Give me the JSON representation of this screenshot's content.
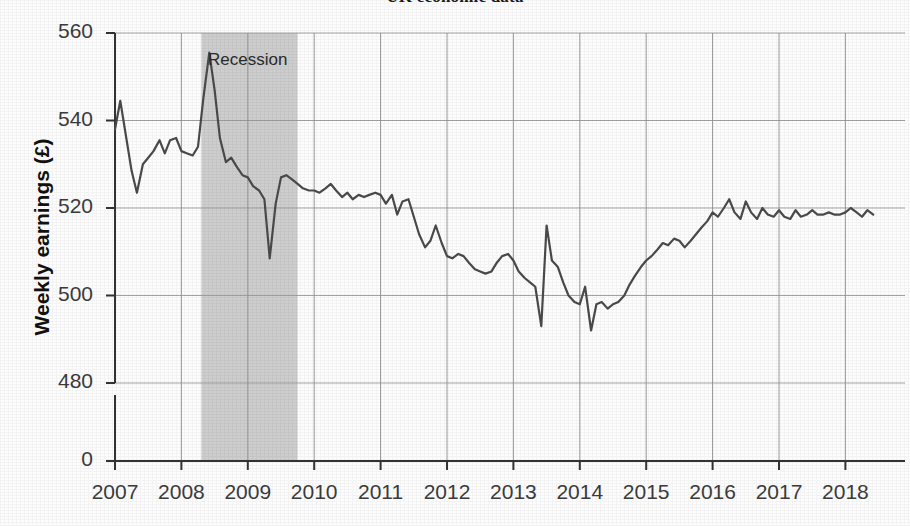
{
  "figure": {
    "title_partial": "UK economic data",
    "recession_label": "Recession"
  },
  "chart_data": {
    "type": "line",
    "title": "UK economic data",
    "xlabel": "",
    "ylabel": "Weekly earnings (£)",
    "ylim": [
      476,
      562
    ],
    "axis_break": true,
    "zero_tick": "0",
    "grid": true,
    "legend": null,
    "ytick_labels": [
      "560",
      "540",
      "520",
      "500",
      "480",
      "0"
    ],
    "ytick_values": [
      560,
      540,
      520,
      500,
      480,
      0
    ],
    "xtick_labels": [
      "2007",
      "2008",
      "2009",
      "2010",
      "2011",
      "2012",
      "2013",
      "2014",
      "2015",
      "2016",
      "2017",
      "2018"
    ],
    "xtick_values": [
      2007,
      2008,
      2009,
      2010,
      2011,
      2012,
      2013,
      2014,
      2015,
      2016,
      2017,
      2018
    ],
    "annotations": [
      {
        "label": "Recession",
        "type": "shaded-band",
        "x_start": 2008.3,
        "x_end": 2009.75,
        "color": "#bdbdbd"
      }
    ],
    "series": [
      {
        "name": "Weekly earnings",
        "color": "#4a4a4a",
        "x": [
          2007.0,
          2007.08,
          2007.17,
          2007.25,
          2007.33,
          2007.42,
          2007.5,
          2007.58,
          2007.67,
          2007.75,
          2007.83,
          2007.92,
          2008.0,
          2008.08,
          2008.17,
          2008.25,
          2008.33,
          2008.42,
          2008.5,
          2008.58,
          2008.67,
          2008.75,
          2008.83,
          2008.92,
          2009.0,
          2009.08,
          2009.17,
          2009.25,
          2009.33,
          2009.42,
          2009.5,
          2009.58,
          2009.67,
          2009.75,
          2009.83,
          2009.92,
          2010.0,
          2010.08,
          2010.17,
          2010.25,
          2010.33,
          2010.42,
          2010.5,
          2010.58,
          2010.67,
          2010.75,
          2010.83,
          2010.92,
          2011.0,
          2011.08,
          2011.17,
          2011.25,
          2011.33,
          2011.42,
          2011.5,
          2011.58,
          2011.67,
          2011.75,
          2011.83,
          2011.92,
          2012.0,
          2012.08,
          2012.17,
          2012.25,
          2012.33,
          2012.42,
          2012.5,
          2012.58,
          2012.67,
          2012.75,
          2012.83,
          2012.92,
          2013.0,
          2013.08,
          2013.17,
          2013.25,
          2013.33,
          2013.42,
          2013.5,
          2013.58,
          2013.67,
          2013.75,
          2013.83,
          2013.92,
          2014.0,
          2014.08,
          2014.17,
          2014.25,
          2014.33,
          2014.42,
          2014.5,
          2014.58,
          2014.67,
          2014.75,
          2014.83,
          2014.92,
          2015.0,
          2015.08,
          2015.17,
          2015.25,
          2015.33,
          2015.42,
          2015.5,
          2015.58,
          2015.67,
          2015.75,
          2015.83,
          2015.92,
          2016.0,
          2016.08,
          2016.17,
          2016.25,
          2016.33,
          2016.42,
          2016.5,
          2016.58,
          2016.67,
          2016.75,
          2016.83,
          2016.92,
          2017.0,
          2017.08,
          2017.17,
          2017.25,
          2017.33,
          2017.42,
          2017.5,
          2017.58,
          2017.67,
          2017.75,
          2017.83,
          2017.92,
          2018.0,
          2018.08,
          2018.17,
          2018.25,
          2018.33,
          2018.42
        ],
        "y": [
          538.0,
          544.5,
          536.0,
          528.5,
          523.5,
          530.0,
          531.5,
          533.0,
          535.5,
          532.5,
          535.5,
          536.0,
          533.0,
          532.5,
          532.0,
          534.0,
          545.0,
          555.5,
          547.0,
          536.0,
          530.5,
          531.5,
          529.5,
          527.5,
          527.0,
          525.0,
          524.0,
          522.0,
          508.5,
          521.0,
          527.0,
          527.5,
          526.5,
          525.5,
          524.5,
          524.0,
          524.0,
          523.5,
          524.5,
          525.5,
          524.0,
          522.5,
          523.5,
          522.0,
          523.0,
          522.5,
          523.0,
          523.5,
          523.0,
          521.0,
          523.0,
          518.5,
          521.5,
          522.0,
          518.0,
          514.0,
          511.0,
          512.5,
          516.0,
          512.0,
          509.0,
          508.5,
          509.5,
          509.0,
          507.5,
          506.0,
          505.5,
          505.0,
          505.5,
          507.5,
          509.0,
          509.5,
          508.0,
          505.5,
          504.0,
          503.0,
          502.0,
          493.0,
          516.0,
          508.0,
          506.5,
          503.0,
          500.0,
          498.5,
          498.0,
          502.0,
          492.0,
          498.0,
          498.5,
          497.0,
          498.0,
          498.5,
          500.0,
          502.5,
          504.5,
          506.5,
          508.0,
          509.0,
          510.5,
          512.0,
          511.5,
          513.0,
          512.5,
          511.0,
          512.5,
          514.0,
          515.5,
          517.0,
          519.0,
          518.0,
          520.0,
          522.0,
          519.0,
          517.5,
          521.5,
          519.0,
          517.5,
          520.0,
          518.5,
          518.0,
          519.5,
          518.0,
          517.5,
          519.5,
          518.0,
          518.5,
          519.5,
          518.5,
          518.5,
          519.0,
          518.5,
          518.5,
          519.0,
          520.0,
          519.0,
          518.0,
          519.5,
          518.5
        ]
      }
    ]
  }
}
